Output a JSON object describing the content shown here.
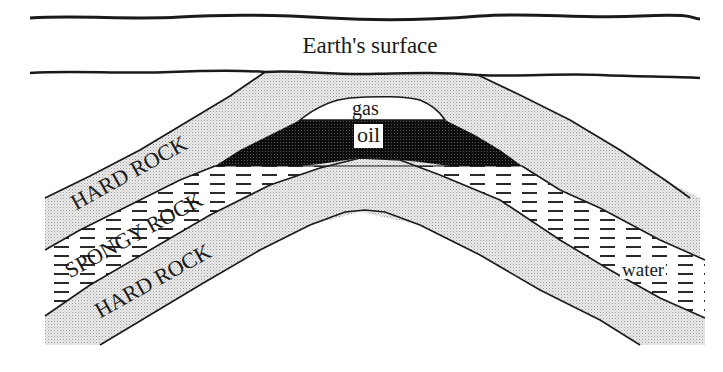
{
  "diagram": {
    "title": "Earth's surface",
    "labels": {
      "surface": "Earth's surface",
      "hard_rock_upper": "HARD ROCK",
      "spongy_rock": "SPONGY ROCK",
      "hard_rock_lower": "HARD ROCK",
      "gas": "gas",
      "oil": "oil",
      "water": "water"
    },
    "layers": [
      {
        "name": "Earth's surface",
        "fill": "#ffffff"
      },
      {
        "name": "HARD ROCK (cap rock)",
        "fill": "stipple",
        "color": "#d9d9d9"
      },
      {
        "name": "gas",
        "fill": "#ffffff"
      },
      {
        "name": "oil",
        "fill": "#111111"
      },
      {
        "name": "SPONGY ROCK (water-bearing)",
        "fill": "dashed",
        "color": "#333333"
      },
      {
        "name": "HARD ROCK (base rock)",
        "fill": "stipple",
        "color": "#d9d9d9"
      }
    ],
    "structure": "anticline trap",
    "colors": {
      "ink": "#1a1a1a",
      "stipple": "#d6d6d6",
      "oil": "#111111",
      "background": "#ffffff"
    }
  }
}
